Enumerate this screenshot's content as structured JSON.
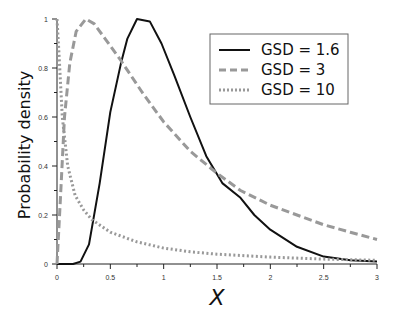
{
  "chart_data": {
    "type": "line",
    "title": "",
    "xlabel": "X",
    "ylabel": "Probability density",
    "xlim": [
      0,
      3
    ],
    "ylim": [
      0,
      1
    ],
    "grid": false,
    "legend_position": "upper right",
    "x_ticks": [
      {
        "value": 0,
        "label": "0"
      },
      {
        "value": 0.5,
        "label": "0.5"
      },
      {
        "value": 1,
        "label": "1"
      },
      {
        "value": 1.5,
        "label": "1.5"
      },
      {
        "value": 2,
        "label": "2"
      },
      {
        "value": 2.5,
        "label": "2.5"
      },
      {
        "value": 3,
        "label": "3"
      }
    ],
    "y_ticks": [
      {
        "value": 0,
        "label": "0"
      },
      {
        "value": 0.2,
        "label": "0.2"
      },
      {
        "value": 0.4,
        "label": "0.4"
      },
      {
        "value": 0.6,
        "label": "0.6"
      },
      {
        "value": 0.8,
        "label": "0.8"
      },
      {
        "value": 1,
        "label": "1"
      }
    ],
    "series": [
      {
        "name": "GSD = 1.6",
        "style": "solid",
        "color": "#111111",
        "points": [
          [
            0,
            0
          ],
          [
            0.15,
            0
          ],
          [
            0.22,
            0.01
          ],
          [
            0.3,
            0.08
          ],
          [
            0.4,
            0.33
          ],
          [
            0.5,
            0.62
          ],
          [
            0.6,
            0.82
          ],
          [
            0.66,
            0.92
          ],
          [
            0.75,
            1.0
          ],
          [
            0.87,
            0.99
          ],
          [
            0.98,
            0.9
          ],
          [
            1.1,
            0.77
          ],
          [
            1.25,
            0.6
          ],
          [
            1.4,
            0.44
          ],
          [
            1.55,
            0.33
          ],
          [
            1.72,
            0.27
          ],
          [
            1.85,
            0.2
          ],
          [
            2.0,
            0.14
          ],
          [
            2.25,
            0.07
          ],
          [
            2.5,
            0.03
          ],
          [
            2.75,
            0.015
          ],
          [
            3.0,
            0.01
          ]
        ]
      },
      {
        "name": "GSD = 3",
        "style": "dashed",
        "color": "#999999",
        "points": [
          [
            0,
            0
          ],
          [
            0.03,
            0.25
          ],
          [
            0.07,
            0.6
          ],
          [
            0.12,
            0.82
          ],
          [
            0.18,
            0.95
          ],
          [
            0.27,
            1.0
          ],
          [
            0.35,
            0.98
          ],
          [
            0.45,
            0.92
          ],
          [
            0.6,
            0.83
          ],
          [
            0.8,
            0.7
          ],
          [
            1.0,
            0.58
          ],
          [
            1.25,
            0.46
          ],
          [
            1.5,
            0.37
          ],
          [
            1.72,
            0.3
          ],
          [
            2.0,
            0.24
          ],
          [
            2.25,
            0.2
          ],
          [
            2.5,
            0.16
          ],
          [
            2.75,
            0.13
          ],
          [
            3.0,
            0.1
          ]
        ]
      },
      {
        "name": "GSD = 10",
        "style": "dotted",
        "color": "#999999",
        "points": [
          [
            0,
            1.0
          ],
          [
            0.02,
            0.85
          ],
          [
            0.05,
            0.6
          ],
          [
            0.1,
            0.4
          ],
          [
            0.17,
            0.28
          ],
          [
            0.25,
            0.22
          ],
          [
            0.33,
            0.18
          ],
          [
            0.5,
            0.13
          ],
          [
            0.75,
            0.09
          ],
          [
            1.0,
            0.065
          ],
          [
            1.25,
            0.05
          ],
          [
            1.5,
            0.04
          ],
          [
            2.0,
            0.028
          ],
          [
            2.5,
            0.02
          ],
          [
            3.0,
            0.015
          ]
        ]
      }
    ]
  },
  "legend": {
    "items": [
      {
        "label": "GSD = 1.6",
        "style": "solid"
      },
      {
        "label": "GSD = 3",
        "style": "dashed"
      },
      {
        "label": "GSD = 10",
        "style": "dotted"
      }
    ]
  }
}
